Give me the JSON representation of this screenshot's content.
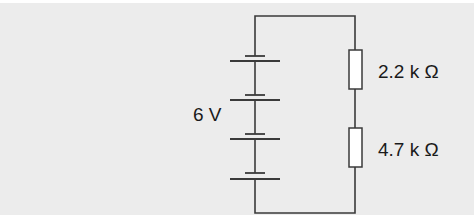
{
  "diagram": {
    "type": "circuit",
    "battery": {
      "label": "6 V",
      "cells": 4
    },
    "resistors": [
      {
        "label": "2.2 k Ω"
      },
      {
        "label": "4.7 k Ω"
      }
    ],
    "colors": {
      "background": "#ececec",
      "wire": "#3a3a3a"
    }
  }
}
